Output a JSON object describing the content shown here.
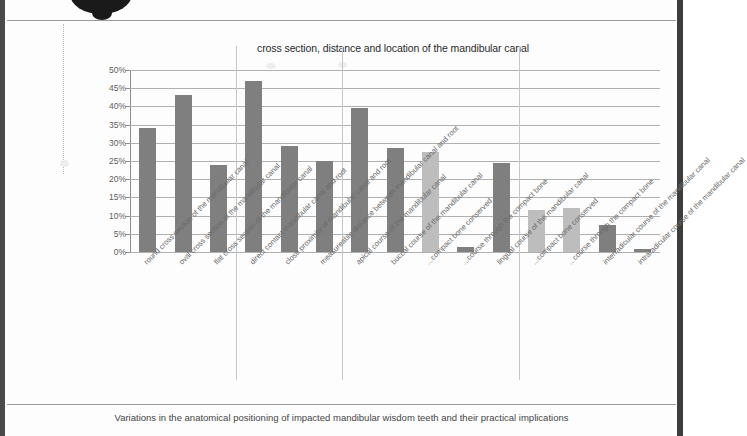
{
  "document": {
    "caption": "Variations in the anatomical positioning of impacted mandibular wisdom teeth and their practical implications"
  },
  "chart_data": {
    "type": "bar",
    "title": "cross section, distance and location of the mandibular canal",
    "xlabel": "",
    "ylabel": "",
    "ylim": [
      0,
      50
    ],
    "ytick_labels": [
      "50%",
      "45%",
      "40%",
      "35%",
      "30%",
      "25%",
      "20%",
      "15%",
      "10%",
      "5%",
      "0%"
    ],
    "ytick_values": [
      50,
      45,
      40,
      35,
      30,
      25,
      20,
      15,
      10,
      5,
      0
    ],
    "grid": true,
    "legend": "none",
    "colors": {
      "dark_bar": "#7f7f7f",
      "light_bar": "#bdbdbd",
      "gridline": "#b0b0b0",
      "axis": "#8d8d8d",
      "text": "#5d5d5d"
    },
    "categories": [
      "round cross section of the mandibular canal",
      "oval cross section of the mandibular canal",
      "flat cross section of the mandibular canal",
      "direct contact mandibular canal and root",
      "close proximity of mandibular canal and root",
      "measureable distance between mandibular canal and root",
      "apical course of the mandibular canal",
      "buccal course of the mandibular canal",
      "...compact bone conserved",
      "...course through the compact bone",
      "lingual course of the mandibular canal",
      "...compact bone conserved",
      "...course through the compact bone",
      "interradicular course of the mandibular canal",
      "intraradicular course of the mandibular canal"
    ],
    "values": [
      34,
      43,
      24,
      47,
      29,
      25,
      39.5,
      28.5,
      27.5,
      1.5,
      24.5,
      11.5,
      12,
      7.5,
      0.7
    ],
    "bar_shades": [
      "dark",
      "dark",
      "dark",
      "dark",
      "dark",
      "dark",
      "dark",
      "dark",
      "light",
      "dark",
      "dark",
      "light",
      "light",
      "dark",
      "dark"
    ],
    "group_separators_after": [
      2,
      5,
      10
    ]
  }
}
